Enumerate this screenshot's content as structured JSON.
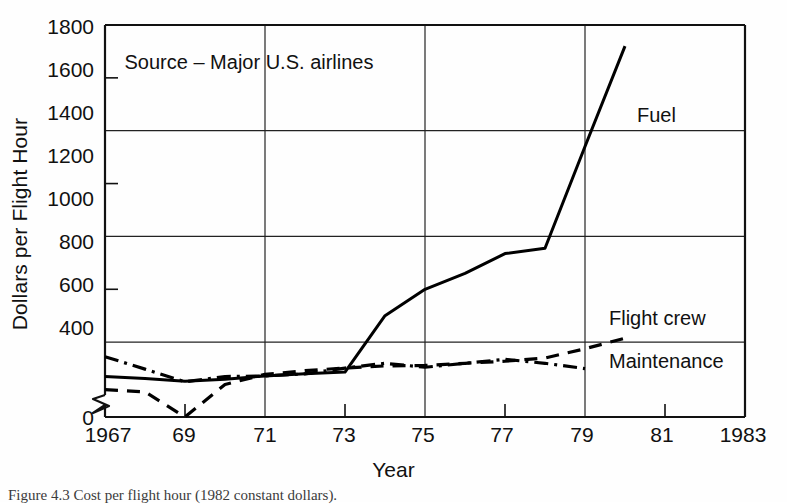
{
  "chart_data": {
    "type": "line",
    "title": "",
    "xlabel": "Year",
    "ylabel": "Dollars per Flight Hour",
    "xlim": [
      1967,
      1983
    ],
    "ylim": [
      0,
      1800
    ],
    "y_axis_break": true,
    "y_break_between": [
      0,
      400
    ],
    "grid": true,
    "gridlines_y": [
      600,
      1000,
      1400,
      1800
    ],
    "gridlines_x": [
      1971,
      1975,
      1979,
      1983
    ],
    "ytick_labels": [
      "0",
      "400",
      "600",
      "800",
      "1000",
      "1200",
      "1400",
      "1600",
      "1800"
    ],
    "ytick_values": [
      0,
      400,
      600,
      800,
      1000,
      1200,
      1400,
      1600,
      1800
    ],
    "xtick_labels": [
      "1967",
      "69",
      "71",
      "73",
      "75",
      "77",
      "79",
      "81",
      "1983"
    ],
    "xtick_values": [
      1967,
      1969,
      1971,
      1973,
      1975,
      1977,
      1979,
      1981,
      1983
    ],
    "legend_position": "inline-annotations",
    "annotations": [
      {
        "text": "Source – Major U.S. airlines",
        "x": 1970.6,
        "y": 1660
      }
    ],
    "series": [
      {
        "name": "Fuel",
        "style": "solid",
        "label_x": 1980.3,
        "label_y": 1460,
        "x": [
          1967,
          1968,
          1969,
          1970,
          1971,
          1972,
          1973,
          1974,
          1975,
          1976,
          1977,
          1978,
          1979,
          1980
        ],
        "values": [
          470,
          462,
          452,
          460,
          472,
          480,
          487,
          700,
          800,
          860,
          935,
          955,
          1340,
          1720
        ]
      },
      {
        "name": "Flight crew",
        "style": "dashed",
        "label_x": 1979.6,
        "label_y": 690,
        "x": [
          1967,
          1968,
          1969,
          1970,
          1971,
          1972,
          1973,
          1974,
          1975,
          1976,
          1977,
          1978,
          1979,
          1980
        ],
        "values": [
          420,
          412,
          398,
          440,
          478,
          492,
          502,
          510,
          512,
          520,
          528,
          540,
          575,
          615
        ]
      },
      {
        "name": "Maintenance",
        "style": "dash-dot",
        "label_x": 1979.6,
        "label_y": 530,
        "x": [
          1967,
          1968,
          1969,
          1970,
          1971,
          1972,
          1973,
          1974,
          1975,
          1976,
          1977,
          1978,
          1979
        ],
        "values": [
          545,
          498,
          450,
          470,
          472,
          480,
          502,
          520,
          505,
          520,
          535,
          520,
          500
        ]
      }
    ]
  },
  "caption": {
    "text": "Figure 4.3   Cost per flight hour (1982 constant dollars)."
  }
}
